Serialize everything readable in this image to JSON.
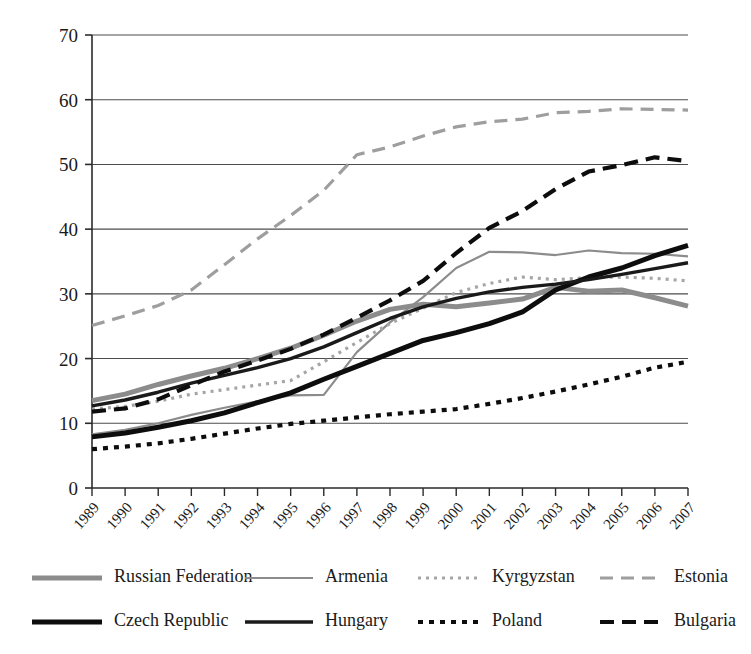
{
  "chart_data": {
    "type": "line",
    "title": "",
    "xlabel": "",
    "ylabel": "",
    "grid": true,
    "legend_position": "bottom",
    "ylim": [
      0,
      70
    ],
    "yticks": [
      0,
      10,
      20,
      30,
      40,
      50,
      60,
      70
    ],
    "x": [
      "1989",
      "1990",
      "1991",
      "1992",
      "1993",
      "1994",
      "1995",
      "1996",
      "1997",
      "1998",
      "1999",
      "2000",
      "2001",
      "2002",
      "2003",
      "2004",
      "2005",
      "2006",
      "2007"
    ],
    "categories": [
      "1989",
      "1990",
      "1991",
      "1992",
      "1993",
      "1994",
      "1995",
      "1996",
      "1997",
      "1998",
      "1999",
      "2000",
      "2001",
      "2002",
      "2003",
      "2004",
      "2005",
      "2006",
      "2007"
    ],
    "series": [
      {
        "name": "Russian Federation",
        "color": "#8c8c8c",
        "width": 5.0,
        "dash": "none",
        "values": [
          13.5,
          14.5,
          16.0,
          17.3,
          18.5,
          20.0,
          21.6,
          23.6,
          25.8,
          27.6,
          28.4,
          28.0,
          28.6,
          29.2,
          31.0,
          30.4,
          30.6,
          29.4,
          28.1
        ]
      },
      {
        "name": "Armenia",
        "color": "#8c8c8c",
        "width": 2.2,
        "dash": "none",
        "values": [
          8.3,
          9.0,
          10.0,
          11.3,
          12.4,
          13.4,
          14.3,
          14.4,
          21.0,
          25.6,
          29.5,
          34.0,
          36.5,
          36.4,
          36.0,
          36.7,
          36.3,
          36.2,
          35.8
        ]
      },
      {
        "name": "Kyrgyzstan",
        "color": "#a6a6a6",
        "width": 3.2,
        "dash": "3,5",
        "values": [
          12.2,
          12.6,
          13.4,
          14.5,
          15.2,
          15.9,
          16.6,
          19.5,
          22.5,
          25.4,
          27.8,
          30.2,
          31.6,
          32.6,
          32.2,
          32.5,
          32.6,
          32.4,
          32.0
        ]
      },
      {
        "name": "Estonia",
        "color": "#9e9e9e",
        "width": 3.2,
        "dash": "13,8",
        "values": [
          25.1,
          26.6,
          28.2,
          30.6,
          34.5,
          38.5,
          42.1,
          46.0,
          51.5,
          52.7,
          54.4,
          55.8,
          56.6,
          57.0,
          58.0,
          58.2,
          58.6,
          58.5,
          58.4
        ]
      },
      {
        "name": "Czech Republic",
        "color": "#0d0d0d",
        "width": 5.0,
        "dash": "none",
        "values": [
          7.9,
          8.5,
          9.4,
          10.4,
          11.6,
          13.2,
          14.7,
          16.8,
          18.8,
          20.8,
          22.8,
          24.0,
          25.4,
          27.2,
          30.6,
          32.6,
          34.0,
          35.9,
          37.5
        ]
      },
      {
        "name": "Hungary",
        "color": "#1a1a1a",
        "width": 3.4,
        "dash": "none",
        "values": [
          12.7,
          13.6,
          14.8,
          16.2,
          17.4,
          18.6,
          20.0,
          21.8,
          24.0,
          26.2,
          28.0,
          29.3,
          30.3,
          31.0,
          31.5,
          32.2,
          33.0,
          33.9,
          34.8
        ]
      },
      {
        "name": "Poland",
        "color": "#0d0d0d",
        "width": 4.2,
        "dash": "5,6",
        "values": [
          6.0,
          6.4,
          6.9,
          7.6,
          8.4,
          9.2,
          9.9,
          10.4,
          10.9,
          11.4,
          11.8,
          12.2,
          13.0,
          13.9,
          14.9,
          16.0,
          17.2,
          18.6,
          19.5
        ]
      },
      {
        "name": "Bulgaria",
        "color": "#0d0d0d",
        "width": 4.2,
        "dash": "14,8",
        "values": [
          11.8,
          12.3,
          13.7,
          15.9,
          18.0,
          19.7,
          21.5,
          23.7,
          26.3,
          29.0,
          32.0,
          36.3,
          40.2,
          42.8,
          46.2,
          48.9,
          49.9,
          51.1,
          50.5
        ]
      }
    ]
  },
  "legend": {
    "rows": [
      [
        "Russian Federation",
        "Armenia",
        "Kyrgyzstan",
        "Estonia"
      ],
      [
        "Czech Republic",
        "Hungary",
        "Poland",
        "Bulgaria"
      ]
    ]
  }
}
